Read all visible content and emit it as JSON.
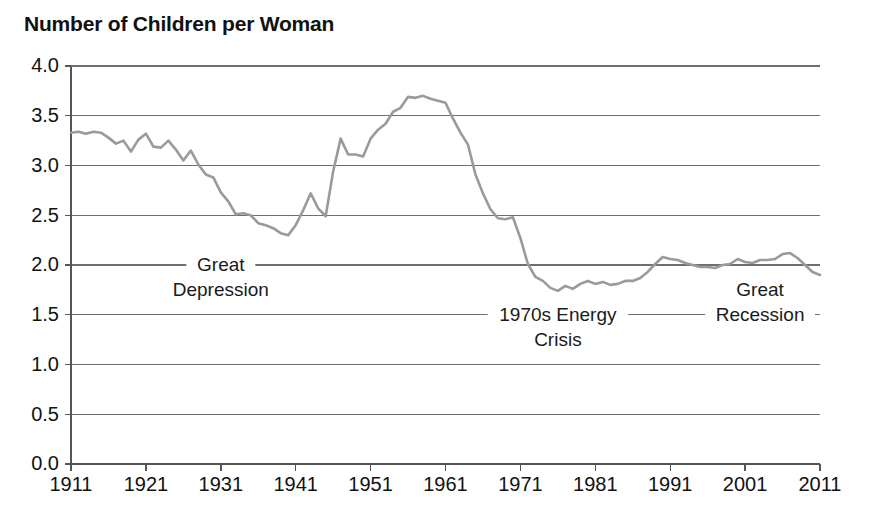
{
  "chart_data": {
    "type": "line",
    "title": "Number of Children per Woman",
    "xlabel": "",
    "ylabel": "",
    "xlim": [
      1911,
      2011
    ],
    "ylim": [
      0.0,
      4.0
    ],
    "grid": true,
    "legend": null,
    "y_ticks": [
      "4.0",
      "3.5",
      "3.0",
      "2.5",
      "2.0",
      "1.5",
      "1.0",
      "0.5",
      "0.0"
    ],
    "y_tick_values": [
      4.0,
      3.5,
      3.0,
      2.5,
      2.0,
      1.5,
      1.0,
      0.5,
      0.0
    ],
    "x_ticks": [
      "1911",
      "1921",
      "1931",
      "1941",
      "1951",
      "1961",
      "1971",
      "1981",
      "1991",
      "2001",
      "2011"
    ],
    "x_tick_values": [
      1911,
      1921,
      1931,
      1941,
      1951,
      1961,
      1971,
      1981,
      1991,
      2001,
      2011
    ],
    "series_name": "Total fertility rate",
    "line_color": "#9a9a9a",
    "x": [
      1911,
      1912,
      1913,
      1914,
      1915,
      1916,
      1917,
      1918,
      1919,
      1920,
      1921,
      1922,
      1923,
      1924,
      1925,
      1926,
      1927,
      1928,
      1929,
      1930,
      1931,
      1932,
      1933,
      1934,
      1935,
      1936,
      1937,
      1938,
      1939,
      1940,
      1941,
      1942,
      1943,
      1944,
      1945,
      1946,
      1947,
      1948,
      1949,
      1950,
      1951,
      1952,
      1953,
      1954,
      1955,
      1956,
      1957,
      1958,
      1959,
      1960,
      1961,
      1962,
      1963,
      1964,
      1965,
      1966,
      1967,
      1968,
      1969,
      1970,
      1971,
      1972,
      1973,
      1974,
      1975,
      1976,
      1977,
      1978,
      1979,
      1980,
      1981,
      1982,
      1983,
      1984,
      1985,
      1986,
      1987,
      1988,
      1989,
      1990,
      1991,
      1992,
      1993,
      1994,
      1995,
      1996,
      1997,
      1998,
      1999,
      2000,
      2001,
      2002,
      2003,
      2004,
      2005,
      2006,
      2007,
      2008,
      2009,
      2010,
      2011
    ],
    "y": [
      3.33,
      3.34,
      3.32,
      3.34,
      3.33,
      3.28,
      3.22,
      3.25,
      3.14,
      3.26,
      3.32,
      3.19,
      3.18,
      3.25,
      3.16,
      3.05,
      3.15,
      3.01,
      2.91,
      2.88,
      2.73,
      2.64,
      2.51,
      2.52,
      2.5,
      2.42,
      2.4,
      2.37,
      2.32,
      2.3,
      2.4,
      2.55,
      2.72,
      2.57,
      2.49,
      2.94,
      3.27,
      3.11,
      3.11,
      3.09,
      3.27,
      3.36,
      3.42,
      3.54,
      3.58,
      3.69,
      3.68,
      3.7,
      3.67,
      3.65,
      3.63,
      3.47,
      3.33,
      3.21,
      2.91,
      2.72,
      2.56,
      2.47,
      2.46,
      2.48,
      2.27,
      2.01,
      1.88,
      1.84,
      1.77,
      1.74,
      1.79,
      1.76,
      1.81,
      1.84,
      1.81,
      1.83,
      1.8,
      1.81,
      1.84,
      1.84,
      1.87,
      1.93,
      2.01,
      2.08,
      2.06,
      2.05,
      2.02,
      2.0,
      1.98,
      1.98,
      1.97,
      2.0,
      2.01,
      2.06,
      2.03,
      2.02,
      2.05,
      2.05,
      2.06,
      2.11,
      2.12,
      2.07,
      2.0,
      1.93,
      1.9
    ],
    "annotations": [
      {
        "id": "great-depression",
        "line1": "Great",
        "line2": "Depression",
        "x_center": 1931,
        "y_line1": 2.0,
        "y_line2": 1.75
      },
      {
        "id": "energy-crisis",
        "line1": "1970s Energy",
        "line2": "Crisis",
        "x_center": 1976,
        "y_line1": 1.5,
        "y_line2": 1.25
      },
      {
        "id": "great-recession",
        "line1": "Great",
        "line2": "Recession",
        "x_center": 2003,
        "y_line1": 1.75,
        "y_line2": 1.5
      }
    ]
  }
}
